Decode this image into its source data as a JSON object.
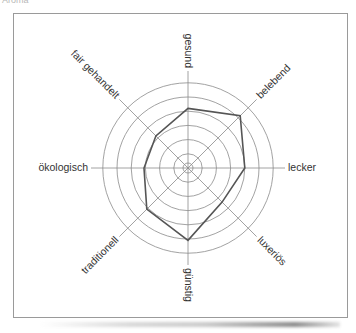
{
  "caption": "Aroma",
  "chart_data": {
    "type": "radar",
    "title": "",
    "axes": [
      "gesund",
      "belebend",
      "lecker",
      "luxeriös",
      "günstig",
      "traditionell",
      "ökologisch",
      "fair gehandelt"
    ],
    "series": [
      {
        "name": "Profil",
        "values": [
          4.2,
          5.2,
          4.0,
          3.4,
          5.1,
          4.1,
          3.1,
          3.2
        ]
      }
    ],
    "rings": 6,
    "range": [
      0,
      6
    ],
    "grid": true,
    "legend": "none"
  },
  "style": {
    "grid_color": "#8a8a8a",
    "line_color": "#555555",
    "frame_color": "#9a9a9a"
  }
}
